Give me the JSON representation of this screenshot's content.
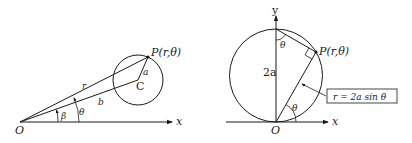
{
  "figures": [
    {
      "id": "left",
      "labels": {
        "origin": "O",
        "x_axis": "x",
        "point": "P(r,θ)",
        "center": "C",
        "radius": "a",
        "r": "r",
        "b": "b",
        "beta": "β",
        "theta": "θ"
      }
    },
    {
      "id": "right",
      "labels": {
        "origin": "O",
        "x_axis": "x",
        "y_axis": "y",
        "point": "P(r,θ)",
        "diameter": "2a",
        "theta_top": "θ",
        "theta_bottom": "θ",
        "equation": "r = 2a sin θ"
      }
    }
  ]
}
